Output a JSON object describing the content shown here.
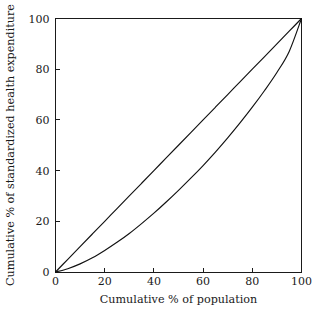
{
  "chart_data": {
    "type": "line",
    "title": "",
    "subtitle": "",
    "xlabel": "Cumulative % of population",
    "ylabel": "Cumulative % of standardized health expenditure",
    "xlim": [
      0,
      100
    ],
    "ylim": [
      0,
      100
    ],
    "grid": false,
    "legend": null,
    "xticks": [
      0,
      20,
      40,
      60,
      80,
      100
    ],
    "yticks": [
      0,
      20,
      40,
      60,
      80,
      100
    ],
    "xtick_labels": [
      "0",
      "20",
      "40",
      "60",
      "80",
      "100"
    ],
    "ytick_labels": [
      "0",
      "20",
      "40",
      "60",
      "80",
      "100"
    ],
    "frame": "box",
    "tick_direction": "in",
    "colors": {
      "line": "#111111",
      "frame": "#1a1a1a",
      "background": "#ffffff",
      "text": "#1a1a1a"
    },
    "x": [
      0,
      5,
      10,
      15,
      20,
      25,
      30,
      35,
      40,
      45,
      50,
      55,
      60,
      65,
      70,
      75,
      80,
      85,
      90,
      95,
      100
    ],
    "series": [
      {
        "name": "line of equality",
        "type": "line",
        "values": [
          0,
          5,
          10,
          15,
          20,
          25,
          30,
          35,
          40,
          45,
          50,
          55,
          60,
          65,
          70,
          75,
          80,
          85,
          90,
          95,
          100
        ]
      },
      {
        "name": "Lorenz curve",
        "type": "line",
        "values": [
          0,
          1.3,
          3.2,
          5.6,
          8.5,
          11.7,
          15.2,
          19.1,
          23.2,
          27.6,
          32.2,
          37.0,
          42.0,
          47.3,
          52.9,
          58.8,
          65.0,
          71.6,
          78.7,
          87.0,
          100
        ]
      }
    ]
  }
}
